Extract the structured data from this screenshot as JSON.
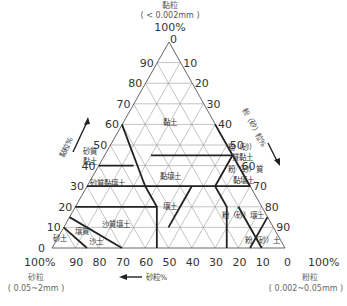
{
  "top_vertex": {
    "title": "黏粒",
    "range": "( < 0.002mm )",
    "percent": "100%",
    "zero": "0"
  },
  "bottom_left": {
    "percent": "100%",
    "zero": "0",
    "title": "砂粒",
    "range": "( 0.05~2mm )"
  },
  "bottom_right": {
    "percent": "100%",
    "zero": "0",
    "title": "粉粒",
    "range": "( 0.002~0.05mm )"
  },
  "axis_labels": {
    "left": "黏粒%",
    "right": "粉（砂）粒%",
    "bottom": "砂粒%"
  },
  "left_ticks": [
    "90",
    "80",
    "70",
    "60",
    "50",
    "40",
    "30",
    "20",
    "10"
  ],
  "right_ticks": [
    "10",
    "20",
    "30",
    "40",
    "50",
    "60",
    "70",
    "80",
    "90"
  ],
  "bottom_ticks": [
    "90",
    "80",
    "70",
    "60",
    "50",
    "40",
    "30",
    "20",
    "10"
  ],
  "regions": [
    {
      "name": "黏土",
      "x": 170,
      "y": 125
    },
    {
      "name": "砂質",
      "x": 90,
      "y": 154
    },
    {
      "name": "黏土",
      "x": 90,
      "y": 164
    },
    {
      "name": "粉（砂）",
      "x": 242,
      "y": 150
    },
    {
      "name": "質黏土",
      "x": 242,
      "y": 160
    },
    {
      "name": "黏壤土",
      "x": 170,
      "y": 179
    },
    {
      "name": "粉（砂）質",
      "x": 245,
      "y": 172
    },
    {
      "name": "黏壤土",
      "x": 243,
      "y": 183
    },
    {
      "name": "砂質黏壤土",
      "x": 107,
      "y": 186
    },
    {
      "name": "壤土",
      "x": 170,
      "y": 209
    },
    {
      "name": "粉（砂）壤土",
      "x": 243,
      "y": 218
    },
    {
      "name": "沙質壤土",
      "x": 116,
      "y": 227
    },
    {
      "name": "壤質",
      "x": 82,
      "y": 234
    },
    {
      "name": "砂土",
      "x": 60,
      "y": 241
    },
    {
      "name": "沙土",
      "x": 96,
      "y": 244
    },
    {
      "name": "粉（砂）土",
      "x": 262,
      "y": 243
    }
  ],
  "colors": {
    "grid": "#9a9a9a",
    "boundary": "#222222",
    "text": "#333333"
  }
}
